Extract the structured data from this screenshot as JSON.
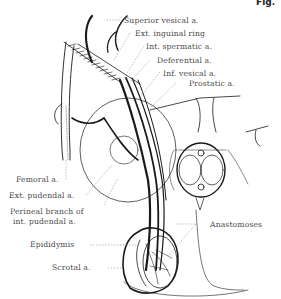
{
  "figure": {
    "fig_label": "Fig.",
    "labels": {
      "superior_vesical": "Superior vesical a.",
      "ext_inguinal_ring": "Ext. inguinal ring",
      "int_spermatic": "Int. spermatic a.",
      "deferential": "Deferential a.",
      "inf_vesical": "Inf. vesical a.",
      "prostatic": "Prostatic a.",
      "femoral": "Femoral a.",
      "ext_pudendal": "Ext. pudendal a.",
      "perineal_line1": "Perineal branch of",
      "perineal_line2": "int. pudendal a.",
      "epididymis": "Epididymis",
      "scrotal": "Scrotal a.",
      "anastomoses": "Anastomoses"
    },
    "colors": {
      "ink": "#1a1a1a",
      "label_text": "#4a4a4a",
      "leader": "#7a7a7a",
      "background": "#ffffff"
    }
  }
}
